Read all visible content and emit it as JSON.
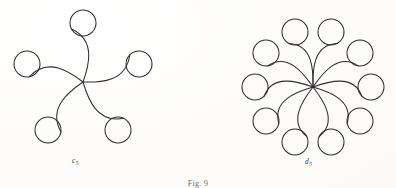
{
  "page": {
    "background_color": "#fdfdfc",
    "ink_color": "#2f2f33",
    "caption": "Fig. 9"
  },
  "figures": [
    {
      "id": "c5",
      "label_base": "c",
      "label_sub": "5",
      "label_text": "c5",
      "kind": "cyclic-rosette",
      "center": {
        "x": 83,
        "y": 82
      },
      "circle_count": 5,
      "circle_radius": 13,
      "orbit_radius": 59,
      "start_angle_deg": -90,
      "tail_sweep_deg": 62,
      "nodes": [
        {
          "index": 0,
          "angle_deg": -90,
          "cx": 83,
          "cy": 23
        },
        {
          "index": 1,
          "angle_deg": -18,
          "cx": 139,
          "cy": 64
        },
        {
          "index": 2,
          "angle_deg": 54,
          "cx": 118,
          "cy": 130
        },
        {
          "index": 3,
          "angle_deg": 126,
          "cx": 48,
          "cy": 130
        },
        {
          "index": 4,
          "angle_deg": 198,
          "cx": 27,
          "cy": 64
        }
      ]
    },
    {
      "id": "d5",
      "label_base": "d",
      "label_sub": "5",
      "label_text": "d5",
      "kind": "dihedral-rosette",
      "center": {
        "x": 313,
        "y": 87
      },
      "circle_count": 10,
      "circle_radius": 13,
      "orbit_radius": 58,
      "pair_count": 5,
      "pair_half_angle_deg": 18,
      "start_angle_deg": -90,
      "tail_sweep_deg": 46,
      "nodes": [
        {
          "index": 0,
          "angle_deg": -108,
          "cx": 295,
          "cy": 32
        },
        {
          "index": 1,
          "angle_deg": -72,
          "cx": 331,
          "cy": 32
        },
        {
          "index": 2,
          "angle_deg": -36,
          "cx": 360,
          "cy": 53
        },
        {
          "index": 3,
          "angle_deg": 0,
          "cx": 371,
          "cy": 87
        },
        {
          "index": 4,
          "angle_deg": 36,
          "cx": 360,
          "cy": 121
        },
        {
          "index": 5,
          "angle_deg": 72,
          "cx": 331,
          "cy": 142
        },
        {
          "index": 6,
          "angle_deg": 108,
          "cx": 295,
          "cy": 142
        },
        {
          "index": 7,
          "angle_deg": 144,
          "cx": 266,
          "cy": 121
        },
        {
          "index": 8,
          "angle_deg": 180,
          "cx": 255,
          "cy": 87
        },
        {
          "index": 9,
          "angle_deg": 216,
          "cx": 266,
          "cy": 53
        }
      ]
    }
  ]
}
